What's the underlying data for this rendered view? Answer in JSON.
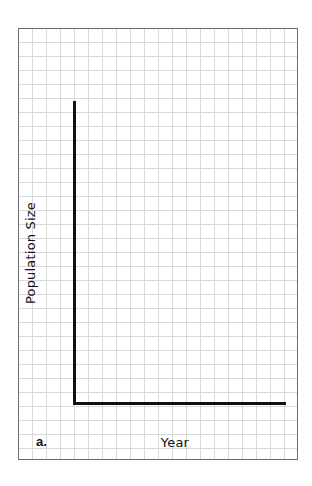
{
  "chart_data": {
    "type": "line",
    "title": "",
    "panel_label": "a.",
    "xlabel": "Year",
    "ylabel": "Population Size",
    "series": [],
    "x": [],
    "categories": [],
    "x_ticks": [],
    "y_ticks": [],
    "grid": true,
    "grid_cell_px": 14,
    "axes_only": true,
    "legend": null,
    "colors": {
      "axes": "#111111",
      "grid": "#d9d9d9",
      "frame": "#6e6e6e",
      "background": "#ffffff"
    }
  },
  "labels": {
    "panel": "a.",
    "x_axis": "Year",
    "y_axis": "Population Size"
  }
}
